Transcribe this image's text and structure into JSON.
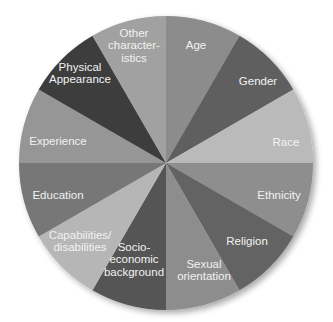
{
  "chart_data": {
    "type": "pie",
    "title": "",
    "start_angle_deg": 0,
    "direction": "clockwise",
    "categories": [
      "Age",
      "Gender",
      "Race",
      "Ethnicity",
      "Religion",
      "Sexual orientation",
      "Socio-economic background",
      "Capabilities/disabilities",
      "Education",
      "Experience",
      "Physical Appearance",
      "Other characteristics"
    ],
    "values": [
      1,
      1,
      1,
      1,
      1,
      1,
      1,
      1,
      1,
      1,
      1,
      1
    ],
    "legend": "none (labels inside slices)"
  },
  "slices": [
    {
      "name": "age",
      "lines": [
        "Age"
      ],
      "color": "#8c8c8c",
      "lx": 196,
      "ly": 45
    },
    {
      "name": "gender",
      "lines": [
        "Gender"
      ],
      "color": "#5e5e5e",
      "lx": 258,
      "ly": 81
    },
    {
      "name": "race",
      "lines": [
        "Race"
      ],
      "color": "#bababa",
      "lx": 286,
      "ly": 142
    },
    {
      "name": "ethnicity",
      "lines": [
        "Ethnicity"
      ],
      "color": "#8e8e8e",
      "lx": 279,
      "ly": 195
    },
    {
      "name": "religion",
      "lines": [
        "Religion"
      ],
      "color": "#646464",
      "lx": 247,
      "ly": 241
    },
    {
      "name": "sexual-orientation",
      "lines": [
        "Sexual",
        "orientation"
      ],
      "color": "#8d8d8d",
      "lx": 204,
      "ly": 270
    },
    {
      "name": "socio-economic-background",
      "lines": [
        "Socio-",
        "economic",
        "background"
      ],
      "color": "#545454",
      "lx": 134,
      "ly": 259
    },
    {
      "name": "capabilities-disabilities",
      "lines": [
        "Capabilities/",
        "disabilities"
      ],
      "color": "#b6b6b6",
      "lx": 80,
      "ly": 241
    },
    {
      "name": "education",
      "lines": [
        "Education"
      ],
      "color": "#777777",
      "lx": 58,
      "ly": 195
    },
    {
      "name": "experience",
      "lines": [
        "Experience"
      ],
      "color": "#969696",
      "lx": 58,
      "ly": 141
    },
    {
      "name": "physical-appearance",
      "lines": [
        "Physical",
        "Appearance"
      ],
      "color": "#3e3e3e",
      "lx": 80,
      "ly": 73
    },
    {
      "name": "other-characteristics",
      "lines": [
        "Other",
        "character-",
        "istics"
      ],
      "color": "#a1a1a1",
      "lx": 134,
      "ly": 45
    }
  ],
  "geometry": {
    "cx": 166,
    "cy": 163,
    "r": 147
  }
}
